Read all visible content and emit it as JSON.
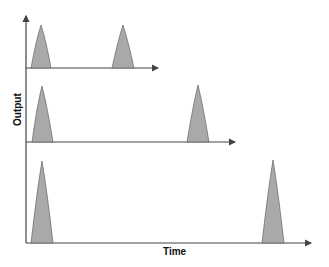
{
  "diagram": {
    "y_axis_label": "Output",
    "x_axis_label": "Time",
    "colors": {
      "peak_fill": "#a9a9a9",
      "axis": "#444444"
    },
    "traces": [
      {
        "name": "trace-1",
        "baseline_y": 68,
        "axis_end_x": 158,
        "peaks": [
          {
            "center_x": 41,
            "half_width": 10,
            "top_y": 25
          },
          {
            "center_x": 123,
            "half_width": 11,
            "top_y": 25
          }
        ]
      },
      {
        "name": "trace-2",
        "baseline_y": 142,
        "axis_end_x": 235,
        "peaks": [
          {
            "center_x": 42,
            "half_width": 10,
            "top_y": 86
          },
          {
            "center_x": 198,
            "half_width": 11,
            "top_y": 85
          }
        ]
      },
      {
        "name": "trace-3",
        "baseline_y": 243,
        "axis_end_x": 311,
        "peaks": [
          {
            "center_x": 42,
            "half_width": 11,
            "top_y": 161
          },
          {
            "center_x": 273,
            "half_width": 11,
            "top_y": 160
          }
        ]
      }
    ]
  }
}
